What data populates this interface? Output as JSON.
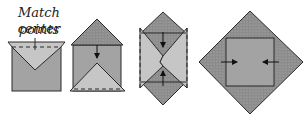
{
  "caption": {
    "line1": "Match center",
    "line2": "points"
  },
  "steps": [
    {
      "id": 1,
      "description": "Square with folded top flap forming a V; dashed fold line and center tick mark"
    },
    {
      "id": 2,
      "description": "Top triangle folded down (arrow down), bottom triangle folded up with dashed line"
    },
    {
      "id": 3,
      "description": "Diamond with top and bottom triangles folded toward center (arrows), dashed side edges"
    },
    {
      "id": 4,
      "description": "Large diamond with inner square; arrows pointing inward from left and right"
    }
  ],
  "colors": {
    "dark_fill": "#8c8c8c",
    "mid_fill": "#a3a3a3",
    "light_fill": "#c6c6c6",
    "outline": "#2a2a2a"
  }
}
